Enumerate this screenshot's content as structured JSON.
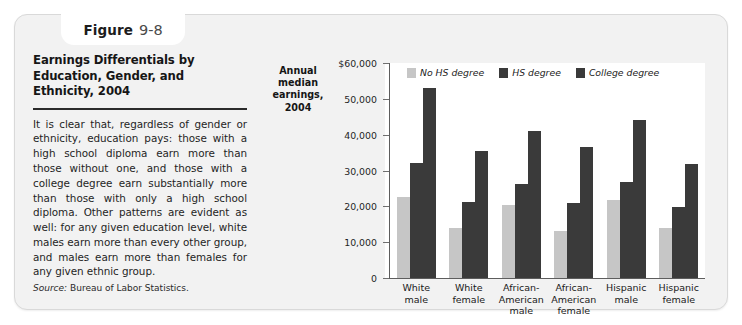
{
  "figure": {
    "tab_word": "Figure",
    "tab_number": "9-8",
    "title": "Earnings Differentials by Education, Gender, and Ethnicity, 2004",
    "body": "It is clear that, regardless of gender or ethnicity, education pays: those with a high school diploma earn more than those without one, and those with a college degree earn substantially more than those with only a high school diploma. Other patterns are evident as well: for any given education level, white males earn more than every other group, and males earn more than females for any given ethnic group.",
    "source_label": "Source:",
    "source_text": " Bureau of Labor Statistics."
  },
  "chart_data": {
    "type": "bar",
    "title": "Earnings Differentials by Education, Gender, and Ethnicity, 2004",
    "xlabel": "",
    "ylabel": "Annual median earnings, 2004",
    "categories": [
      "White male",
      "White female",
      "African-American male",
      "African-American female",
      "Hispanic male",
      "Hispanic female"
    ],
    "category_lines": [
      [
        "White",
        "male"
      ],
      [
        "White",
        "female"
      ],
      [
        "African-",
        "American",
        "male"
      ],
      [
        "African-",
        "American",
        "female"
      ],
      [
        "Hispanic",
        "male"
      ],
      [
        "Hispanic",
        "female"
      ]
    ],
    "series": [
      {
        "name": "No HS degree",
        "color": "#c6c6c6",
        "values": [
          22700,
          14000,
          20400,
          13000,
          21800,
          13900
        ]
      },
      {
        "name": "HS degree",
        "color": "#3a3a3a",
        "values": [
          32200,
          21200,
          26300,
          20900,
          26900,
          19900
        ]
      },
      {
        "name": "College degree",
        "color": "#3a3a3a",
        "values": [
          53000,
          35500,
          41000,
          36700,
          44200,
          31700
        ]
      }
    ],
    "ylim": [
      0,
      60000
    ],
    "yticks": [
      0,
      10000,
      20000,
      30000,
      40000,
      50000,
      60000
    ],
    "ytick_labels": [
      "0",
      "10,000",
      "20,000",
      "30,000",
      "40,000",
      "50,000",
      "$60,000"
    ],
    "grid": false,
    "legend_position": "top-right"
  }
}
